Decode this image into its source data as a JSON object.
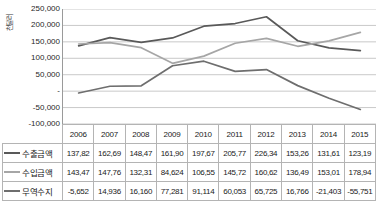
{
  "chart_data": {
    "type": "line",
    "title": "",
    "xlabel": "",
    "ylabel": "천달러",
    "ylim": [
      -100000,
      250000
    ],
    "grid": true,
    "legend_position": "table-below",
    "categories": [
      "2006",
      "2007",
      "2008",
      "2009",
      "2010",
      "2011",
      "2012",
      "2013",
      "2014",
      "2015"
    ],
    "yticks": [
      "250,000",
      "200,000",
      "150,000",
      "100,000",
      "50,000",
      "-",
      "-50,000",
      "-100,000"
    ],
    "ytick_values": [
      250000,
      200000,
      150000,
      100000,
      50000,
      0,
      -50000,
      -100000
    ],
    "series": [
      {
        "name": "수출금액",
        "color": "#595959",
        "values": [
          137827,
          162699,
          148471,
          161900,
          197671,
          205771,
          226340,
          153260,
          131611,
          123190
        ],
        "labels": [
          "137,82",
          "162,69",
          "148,47",
          "161,90",
          "197,67",
          "205,77",
          "226,34",
          "153,26",
          "131,61",
          "123,19"
        ]
      },
      {
        "name": "수입금액",
        "color": "#a6a6a6",
        "values": [
          143479,
          147763,
          132311,
          84624,
          106557,
          145718,
          160615,
          136494,
          153014,
          178941
        ],
        "labels": [
          "143,47",
          "147,76",
          "132,31",
          "84,624",
          "106,55",
          "145,72",
          "160,62",
          "136,49",
          "153,01",
          "178,94"
        ]
      },
      {
        "name": "무역수지",
        "color": "#6e6e6e",
        "values": [
          -5652,
          14936,
          16160,
          77281,
          91114,
          60053,
          65725,
          16766,
          -21403,
          -55751
        ],
        "labels": [
          "-5,652",
          "14,936",
          "16,160",
          "77,281",
          "91,114",
          "60,053",
          "65,725",
          "16,766",
          "-21,403",
          "-55,751"
        ]
      }
    ]
  },
  "axis": {
    "y_title": "천달러"
  },
  "table": {
    "header_corner": "",
    "years": [
      "2006",
      "2007",
      "2008",
      "2009",
      "2010",
      "2011",
      "2012",
      "2013",
      "2014",
      "2015"
    ],
    "rows": [
      {
        "label": "수출금액",
        "color": "#595959",
        "values": [
          "137,82",
          "162,69",
          "148,47",
          "161,90",
          "197,67",
          "205,77",
          "226,34",
          "153,26",
          "131,61",
          "123,19"
        ]
      },
      {
        "label": "수입금액",
        "color": "#a6a6a6",
        "values": [
          "143,47",
          "147,76",
          "132,31",
          "84,624",
          "106,55",
          "145,72",
          "160,62",
          "136,49",
          "153,01",
          "178,94"
        ]
      },
      {
        "label": "무역수지",
        "color": "#6e6e6e",
        "values": [
          "-5,652",
          "14,936",
          "16,160",
          "77,281",
          "91,114",
          "60,053",
          "65,725",
          "16,766",
          "-21,403",
          "-55,751"
        ]
      }
    ]
  },
  "colors": {
    "gridline": "#c9c9c9",
    "axis": "#9a9a9a",
    "table_border": "#b4b4b4",
    "text": "#1a1a1a"
  }
}
